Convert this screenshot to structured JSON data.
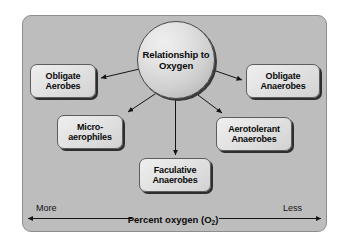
{
  "figure": {
    "panel_color": "#bdbdbd",
    "node_fill": "#e4e4e4",
    "outline_color": "#5d5d5d"
  },
  "center": {
    "label": "Relationship\nto\nOxygen"
  },
  "nodes": [
    {
      "id": "obligate-aerobes",
      "label": "Obligate\nAerobes"
    },
    {
      "id": "microaerophiles",
      "label": "Micro-\naerophiles"
    },
    {
      "id": "faculative-anaerobes",
      "label": "Faculative\nAnaerobes"
    },
    {
      "id": "obligate-anaerobes",
      "label": "Obligate\nAnaerobes"
    },
    {
      "id": "aerotolerant-anaerobes",
      "label": "Aerotolerant\nAnaerobes"
    }
  ],
  "axis": {
    "left_label": "More",
    "right_label": "Less",
    "caption_prefix": "Percent oxygen (O",
    "caption_subscript": "2",
    "caption_suffix": ")"
  }
}
